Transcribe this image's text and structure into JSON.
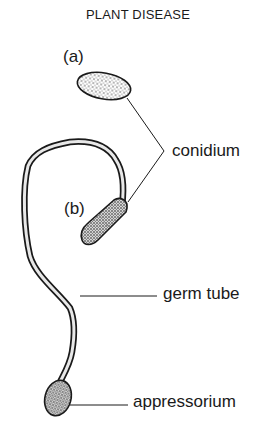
{
  "header": {
    "title": "PLANT DISEASE"
  },
  "figure": {
    "panel_labels": [
      "(a)",
      "(b)"
    ],
    "labels": {
      "conidium": "conidium",
      "germ_tube": "germ tube",
      "appressorium": "appressorium"
    },
    "colors": {
      "ink": "#1a1a1a",
      "background": "#ffffff",
      "stipple": "#3a3a3a"
    }
  }
}
